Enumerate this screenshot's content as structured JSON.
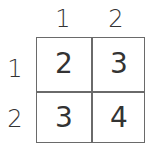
{
  "table": {
    "operation": "addition",
    "column_headers": [
      "1",
      "2"
    ],
    "row_headers": [
      "1",
      "2"
    ],
    "cells": [
      [
        "2",
        "3"
      ],
      [
        "3",
        "4"
      ]
    ]
  }
}
